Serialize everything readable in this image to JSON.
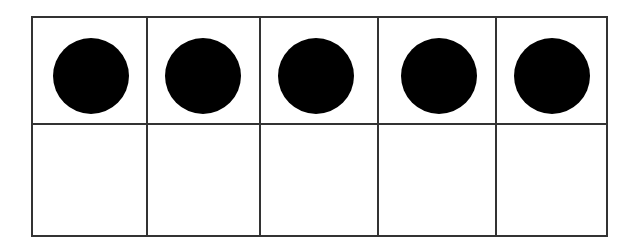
{
  "ten_frame": {
    "rows": 2,
    "columns": 5,
    "filled_count": 5,
    "total_cells": 10,
    "line_color": "#333333",
    "counter_color": "#000000",
    "cells": [
      {
        "row": 1,
        "col": 1,
        "filled": true
      },
      {
        "row": 1,
        "col": 2,
        "filled": true
      },
      {
        "row": 1,
        "col": 3,
        "filled": true
      },
      {
        "row": 1,
        "col": 4,
        "filled": true
      },
      {
        "row": 1,
        "col": 5,
        "filled": true
      },
      {
        "row": 2,
        "col": 1,
        "filled": false
      },
      {
        "row": 2,
        "col": 2,
        "filled": false
      },
      {
        "row": 2,
        "col": 3,
        "filled": false
      },
      {
        "row": 2,
        "col": 4,
        "filled": false
      },
      {
        "row": 2,
        "col": 5,
        "filled": false
      }
    ]
  }
}
